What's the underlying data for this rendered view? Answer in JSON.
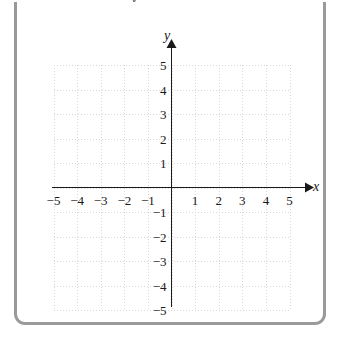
{
  "figure": {
    "kind": "cartesian-coordinate-grid",
    "frame_color": "#9a9a9a",
    "background_color": "#ffffff",
    "axis_color": "#1a1a1a",
    "grid_color": "#d8d8d8",
    "top_clipped_glyph": "y"
  },
  "axes": {
    "x": {
      "label": "x",
      "min": -5,
      "max": 5,
      "step": 1,
      "arrow": "right",
      "tick_labels": [
        "-5",
        "-4",
        "-3",
        "-2",
        "-1",
        "1",
        "2",
        "3",
        "4",
        "5"
      ],
      "tick_values": [
        -5,
        -4,
        -3,
        -2,
        -1,
        1,
        2,
        3,
        4,
        5
      ]
    },
    "y": {
      "label": "y",
      "min": -5,
      "max": 5,
      "step": 1,
      "arrow": "up",
      "tick_labels": [
        "5",
        "4",
        "3",
        "2",
        "1",
        "-1",
        "-2",
        "-3",
        "-4",
        "-5"
      ],
      "tick_values": [
        5,
        4,
        3,
        2,
        1,
        -1,
        -2,
        -3,
        -4,
        -5
      ]
    }
  },
  "chart_data": {
    "type": "scatter",
    "title": "",
    "xlabel": "x",
    "ylabel": "y",
    "xlim": [
      -5,
      5
    ],
    "ylim": [
      -5,
      5
    ],
    "grid": true,
    "legend": "none",
    "series": [],
    "annotations": [],
    "xticks": [
      -5,
      -4,
      -3,
      -2,
      -1,
      1,
      2,
      3,
      4,
      5
    ],
    "yticks": [
      -5,
      -4,
      -3,
      -2,
      -1,
      1,
      2,
      3,
      4,
      5
    ]
  }
}
